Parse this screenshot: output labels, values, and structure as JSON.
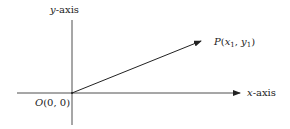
{
  "diagram": {
    "type": "coordinate-vector",
    "labels": {
      "y_axis": {
        "var": "y",
        "suffix": "-axis"
      },
      "x_axis": {
        "var": "x",
        "suffix": "-axis"
      },
      "origin": {
        "name": "O",
        "coords": "(0, 0)"
      },
      "point": {
        "name": "P",
        "open": "(",
        "x": "x",
        "x_sub": "1",
        "sep": ", ",
        "y": "y",
        "y_sub": "1",
        "close": ")"
      }
    },
    "colors": {
      "line": "#222222",
      "text": "#222222",
      "background": "#ffffff"
    },
    "geometry": {
      "origin": [
        72,
        93
      ],
      "x_axis": {
        "from": [
          17,
          93
        ],
        "to": [
          240,
          93
        ],
        "arrow": true
      },
      "y_axis": {
        "from": [
          72,
          20
        ],
        "to": [
          72,
          125
        ],
        "arrow": false
      },
      "vector": {
        "from": [
          72,
          93
        ],
        "to": [
          201,
          41
        ],
        "arrow": true
      }
    }
  }
}
